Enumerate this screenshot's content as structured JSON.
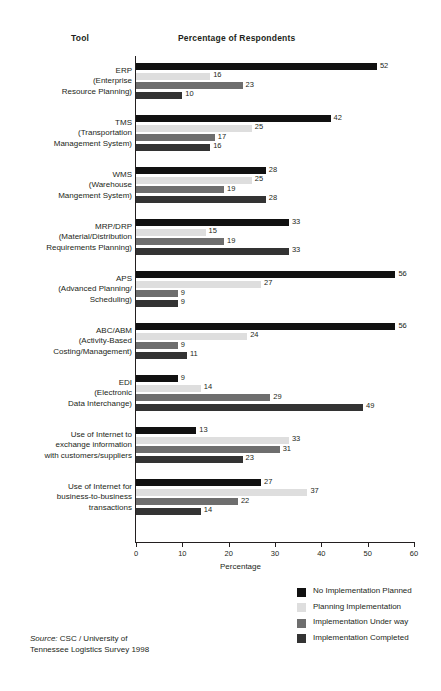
{
  "header": {
    "col_tool": "Tool",
    "col_percentage": "Percentage of Respondents"
  },
  "source": {
    "label": "Source:",
    "text": " CSC / University of",
    "line2": "Tennessee Logistics Survey 1998"
  },
  "legend": {
    "items": [
      {
        "label": "No Implementation Planned",
        "color": "#111111"
      },
      {
        "label": "Planning Implementation",
        "color": "#dedede"
      },
      {
        "label": "Implementation Under way",
        "color": "#6e6e6e"
      },
      {
        "label": "Implementation Completed",
        "color": "#333333"
      }
    ]
  },
  "chart_data": {
    "type": "bar",
    "orientation": "horizontal",
    "title": "Percentage of Respondents",
    "xlabel": "Percentage",
    "ylabel": "Tool",
    "xlim": [
      0,
      60
    ],
    "xticks": [
      0,
      10,
      20,
      30,
      40,
      50,
      60
    ],
    "grid": false,
    "legend_position": "bottom-right",
    "series": [
      {
        "name": "No Implementation Planned",
        "color": "#111111",
        "values": [
          52,
          42,
          28,
          33,
          56,
          56,
          9,
          13,
          27
        ]
      },
      {
        "name": "Planning Implementation",
        "color": "#dedede",
        "values": [
          16,
          25,
          25,
          15,
          27,
          24,
          14,
          33,
          37
        ]
      },
      {
        "name": "Implementation Under way",
        "color": "#6e6e6e",
        "values": [
          23,
          17,
          19,
          19,
          9,
          9,
          29,
          31,
          22
        ]
      },
      {
        "name": "Implementation Completed",
        "color": "#333333",
        "values": [
          10,
          16,
          28,
          33,
          9,
          11,
          49,
          23,
          14
        ]
      }
    ],
    "categories": [
      {
        "lines": [
          "ERP",
          "(Enterprise",
          "Resource Planning)"
        ]
      },
      {
        "lines": [
          "TMS",
          "(Transportation",
          "Management System)"
        ]
      },
      {
        "lines": [
          "WMS",
          "(Warehouse",
          "Mangement System)"
        ]
      },
      {
        "lines": [
          "MRP/DRP",
          "(Material/Distribution",
          "Requirements Planning)"
        ]
      },
      {
        "lines": [
          "APS",
          "(Advanced Planning/",
          "Scheduling)"
        ]
      },
      {
        "lines": [
          "ABC/ABM",
          "(Activity-Based",
          "Costing/Management)"
        ]
      },
      {
        "lines": [
          "EDI",
          "(Electronic",
          "Data Interchange)"
        ]
      },
      {
        "lines": [
          "Use of Internet to",
          "exchange information",
          "with customers/suppliers"
        ]
      },
      {
        "lines": [
          "Use of Internet for",
          "business-to-business",
          "transactions"
        ]
      }
    ]
  }
}
